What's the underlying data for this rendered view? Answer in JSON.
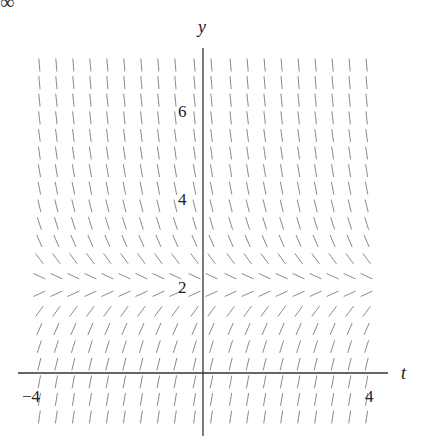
{
  "figure": {
    "corner_glyph": "∞",
    "x_axis_label": "t",
    "y_axis_label": "y",
    "tick_labels": {
      "x_neg": "−4",
      "x_pos": "4",
      "y_2": "2",
      "y_4": "4",
      "y_6": "6"
    },
    "colors": {
      "axis": "#333333",
      "segment": "#8a8a8a",
      "text": "#222222"
    }
  },
  "chart_data": {
    "type": "slope_field",
    "title": "",
    "xlabel": "t",
    "ylabel": "y",
    "xlim": [
      -4,
      4
    ],
    "ylim": [
      -1.4,
      7.5
    ],
    "xticks_labeled": [
      -4,
      4
    ],
    "yticks_labeled": [
      2,
      4,
      6
    ],
    "equilibrium_y": 2,
    "grid": {
      "t_values": [
        -3.85,
        -3.45,
        -3.05,
        -2.65,
        -2.25,
        -1.85,
        -1.45,
        -1.05,
        -0.65,
        -0.2,
        0.2,
        0.65,
        1.05,
        1.45,
        1.85,
        2.25,
        2.65,
        3.05,
        3.45,
        3.85
      ],
      "y_values": [
        7.0,
        6.6,
        6.2,
        5.8,
        5.4,
        5.0,
        4.6,
        4.2,
        3.8,
        3.4,
        3.0,
        2.6,
        2.2,
        1.8,
        1.4,
        1.0,
        0.6,
        0.2,
        -0.2,
        -0.6,
        -1.0
      ]
    },
    "slope_rule": "dy/dt = 2.2*(2 - y)"
  }
}
